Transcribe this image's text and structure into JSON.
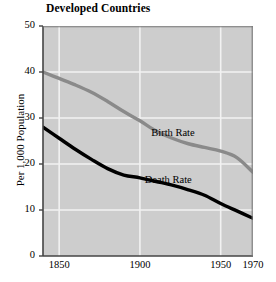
{
  "chart_data": {
    "type": "line",
    "title": "Developed Countries",
    "xlabel": "",
    "ylabel": "Per 1,000 Population",
    "xlim": [
      1840,
      1970
    ],
    "ylim": [
      0,
      50
    ],
    "xticks": [
      1850,
      1900,
      1950,
      1970
    ],
    "xtick_labels": [
      "1850",
      "1900",
      "1950",
      "1970"
    ],
    "yticks": [
      0,
      10,
      20,
      30,
      40,
      50
    ],
    "ytick_labels": [
      "0",
      "10",
      "20",
      "30",
      "40",
      "50"
    ],
    "gridlines_x": [
      1850,
      1900,
      1950
    ],
    "gridlines_y": [
      10,
      20,
      30,
      40
    ],
    "grid": true,
    "legend_position": "inline-annotations",
    "plot_background": "#cdcdcd",
    "grid_color": "#f2f2f2",
    "series": [
      {
        "name": "Birth Rate",
        "color": "#8a8a8a",
        "label_x": 1907,
        "label_y": 26.6,
        "x": [
          1840,
          1850,
          1860,
          1870,
          1880,
          1890,
          1900,
          1910,
          1920,
          1930,
          1940,
          1950,
          1960,
          1970
        ],
        "values": [
          40.0,
          38.6,
          37.2,
          35.6,
          33.6,
          31.4,
          29.4,
          27.2,
          25.6,
          24.4,
          23.6,
          22.8,
          21.4,
          18.2
        ]
      },
      {
        "name": "Death Rate",
        "color": "#000000",
        "label_x": 1903,
        "label_y": 16.2,
        "x": [
          1840,
          1850,
          1860,
          1870,
          1880,
          1890,
          1900,
          1910,
          1920,
          1930,
          1940,
          1950,
          1960,
          1970
        ],
        "values": [
          28.0,
          25.6,
          23.2,
          21.0,
          19.0,
          17.6,
          17.0,
          16.2,
          15.4,
          14.4,
          13.2,
          11.4,
          9.8,
          8.2
        ]
      }
    ]
  }
}
